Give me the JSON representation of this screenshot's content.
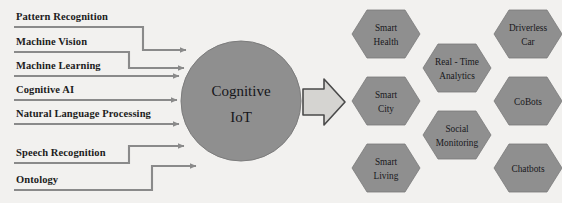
{
  "diagram": {
    "title": "Cognitive IoT",
    "background_color": "#f2f1ef",
    "shape_fill": "#8f8f8f",
    "shape_stroke": "#6e6e6e",
    "line_color": "#8a8a8a",
    "text_color": "#18181c",
    "arrow_fill": "#d5d4d1",
    "arrow_stroke": "#4a4a4a"
  },
  "center": {
    "line1": "Cognitive",
    "line2": "IoT"
  },
  "inputs": [
    {
      "label": "Pattern Recognition"
    },
    {
      "label": "Machine Vision"
    },
    {
      "label": "Machine Learning"
    },
    {
      "label": "Cognitive AI"
    },
    {
      "label": "Natural Language Processing"
    },
    {
      "label": "Speech Recognition"
    },
    {
      "label": "Ontology"
    }
  ],
  "outputs": {
    "column_left": [
      {
        "line1": "Smart",
        "line2": "Health"
      },
      {
        "line1": "Smart",
        "line2": "City"
      },
      {
        "line1": "Smart",
        "line2": "Living"
      }
    ],
    "column_middle": [
      {
        "line1": "Real - Time",
        "line2": "Analytics"
      },
      {
        "line1": "Social",
        "line2": "Monitoring"
      }
    ],
    "column_right": [
      {
        "line1": "Driverless",
        "line2": "Car"
      },
      {
        "line1": "CoBots",
        "line2": ""
      },
      {
        "line1": "Chatbots",
        "line2": ""
      }
    ]
  }
}
